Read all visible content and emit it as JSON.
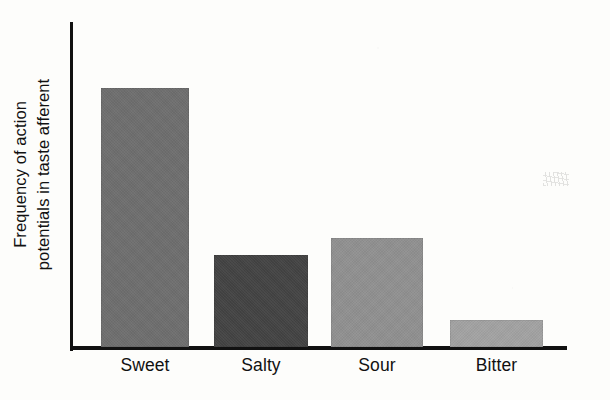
{
  "chart_data": {
    "type": "bar",
    "title": "",
    "xlabel": "",
    "ylabel": "Frequency of action potentials in taste afferent",
    "ylabel_lines": [
      "Frequency of action",
      "potentials in taste afferent"
    ],
    "categories": [
      "Sweet",
      "Salty",
      "Sour",
      "Bitter"
    ],
    "values": [
      100,
      36,
      42,
      11
    ],
    "ylim": [
      0,
      125
    ],
    "grid": false,
    "legend": false,
    "axis_ticks": false,
    "axis_tick_labels": false,
    "bar_colors": [
      "#6e6e6e",
      "#434343",
      "#909090",
      "#a2a2a2"
    ],
    "series": [
      {
        "name": "Frequency of action potentials in taste afferent",
        "values": [
          100,
          36,
          42,
          11
        ]
      }
    ],
    "bars": [
      {
        "label": "Sweet",
        "value": 100,
        "color": "#6e6e6e",
        "x": 101,
        "width": 88,
        "top": 88,
        "height": 259
      },
      {
        "label": "Salty",
        "value": 36,
        "color": "#434343",
        "x": 214,
        "width": 94,
        "top": 255,
        "height": 92
      },
      {
        "label": "Sour",
        "value": 42,
        "color": "#909090",
        "x": 331,
        "width": 92,
        "top": 238,
        "height": 109
      },
      {
        "label": "Bitter",
        "value": 11,
        "color": "#a2a2a2",
        "x": 450,
        "width": 93,
        "top": 320,
        "height": 27
      }
    ],
    "axis_color": "#111111",
    "background_color": "#fdfdfb"
  }
}
